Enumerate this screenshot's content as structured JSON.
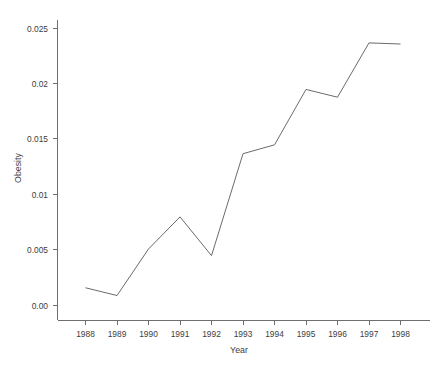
{
  "chart_data": {
    "type": "line",
    "title": "",
    "xlabel": "Year",
    "ylabel": "Obesity",
    "categories": [
      1988,
      1989,
      1990,
      1991,
      1992,
      1993,
      1994,
      1995,
      1996,
      1997,
      1998
    ],
    "x_tick_labels": [
      "1988",
      "1989",
      "1990",
      "1991",
      "1992",
      "1993",
      "1994",
      "1995",
      "1996",
      "1997",
      "1998"
    ],
    "values": [
      0.0016,
      0.0009,
      0.0051,
      0.008,
      0.0045,
      0.0137,
      0.0145,
      0.0195,
      0.0188,
      0.0237,
      0.0236
    ],
    "y_tick_labels": [
      "0.00",
      "0.005",
      "0.01",
      "0.015",
      "0.02",
      "0.025"
    ],
    "y_tick_values": [
      0.0,
      0.005,
      0.01,
      0.015,
      0.02,
      0.025
    ],
    "ylim": [
      -0.0013,
      0.0253
    ],
    "xlim": [
      1987.4,
      1999.0
    ],
    "grid": false,
    "legend": null,
    "line_color": "#6b6b6b",
    "axis_color": "#6f6f6f",
    "text_color": "#3d3d3d",
    "background_color": "#ffffff"
  },
  "caption": {
    "partial_text": ""
  }
}
